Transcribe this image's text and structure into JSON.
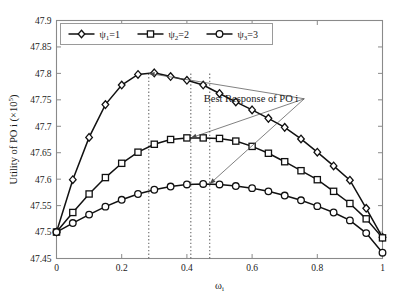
{
  "chart_data": {
    "type": "line",
    "title": "",
    "xlabel": "ωi",
    "xlabel_base": "ω",
    "xlabel_sub": "i",
    "ylabel": "Utility of PO i (×10⁵)",
    "ylabel_base": "Utility of PO i (×10",
    "ylabel_sup": "5",
    "ylabel_tail": ")",
    "xlim": [
      0,
      1
    ],
    "ylim": [
      47.45,
      47.9
    ],
    "xticks": [
      "0",
      "0.2",
      "0.4",
      "0.6",
      "0.8",
      "1"
    ],
    "xtick_values": [
      0,
      0.2,
      0.4,
      0.6,
      0.8,
      1
    ],
    "yticks": [
      "47.45",
      "47.5",
      "47.55",
      "47.6",
      "47.65",
      "47.7",
      "47.75",
      "47.8",
      "47.85",
      "47.9"
    ],
    "ytick_values": [
      47.45,
      47.5,
      47.55,
      47.6,
      47.65,
      47.7,
      47.75,
      47.8,
      47.85,
      47.9
    ],
    "grid": false,
    "legend_position": "top-center",
    "x": [
      0,
      0.05,
      0.1,
      0.15,
      0.2,
      0.25,
      0.3,
      0.35,
      0.4,
      0.45,
      0.5,
      0.55,
      0.6,
      0.65,
      0.7,
      0.75,
      0.8,
      0.85,
      0.9,
      0.95,
      1
    ],
    "series": [
      {
        "name": "ψ₁=1",
        "name_base": "ψ",
        "name_sub": "1",
        "name_value": "=1",
        "marker": "diamond",
        "color": "#111111",
        "values": [
          47.5,
          47.599,
          47.679,
          47.741,
          47.778,
          47.798,
          47.801,
          47.794,
          47.787,
          47.778,
          47.762,
          47.746,
          47.731,
          47.715,
          47.698,
          47.676,
          47.651,
          47.625,
          47.598,
          47.545,
          47.49
        ]
      },
      {
        "name": "ψ₂=2",
        "name_base": "ψ",
        "name_sub": "2",
        "name_value": "=2",
        "marker": "square",
        "color": "#111111",
        "values": [
          47.5,
          47.537,
          47.572,
          47.603,
          47.63,
          47.651,
          47.666,
          47.675,
          47.678,
          47.678,
          47.677,
          47.672,
          47.662,
          47.649,
          47.633,
          47.616,
          47.599,
          47.577,
          47.554,
          47.525,
          47.489
        ]
      },
      {
        "name": "ψ₃=3",
        "name_base": "ψ",
        "name_sub": "3",
        "name_value": "=3",
        "marker": "circle",
        "color": "#111111",
        "values": [
          47.5,
          47.517,
          47.533,
          47.548,
          47.561,
          47.572,
          47.58,
          47.586,
          47.59,
          47.591,
          47.59,
          47.587,
          47.583,
          47.577,
          47.569,
          47.56,
          47.549,
          47.537,
          47.522,
          47.498,
          47.461
        ]
      }
    ],
    "vertical_markers": [
      0.283,
      0.412,
      0.47
    ],
    "annotations": [
      {
        "text": "Best Response of PO i",
        "x": 0.76,
        "y": 47.752,
        "targets": [
          [
            0.283,
            47.8
          ],
          [
            0.412,
            47.678
          ],
          [
            0.47,
            47.591
          ]
        ]
      }
    ]
  },
  "legend": {
    "entries": [
      "ψ₁=1",
      "ψ₂=2",
      "ψ₃=3"
    ]
  }
}
